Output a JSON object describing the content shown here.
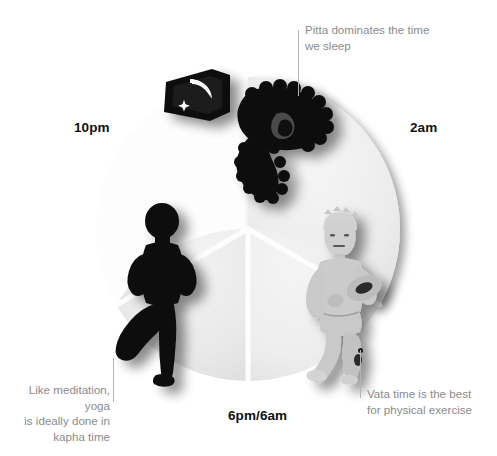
{
  "diagram": {
    "title_present": false,
    "shape": "circle-divided-in-three",
    "segments": [
      {
        "id": "pitta",
        "name": "pitta-segment",
        "position": "top",
        "fill": "#efefef",
        "icon_names": [
          "window-with-moon-and-star-icon",
          "sleeping-person-in-bed-icon"
        ]
      },
      {
        "id": "kapha",
        "name": "kapha-segment",
        "position": "bottom-left",
        "fill": "#ededed",
        "icon_names": [
          "yoga-tree-pose-silhouette-icon"
        ]
      },
      {
        "id": "vata",
        "name": "vata-segment",
        "position": "bottom-right",
        "fill": "#f2f2f2",
        "icon_names": [
          "running-person-with-football-icon"
        ]
      }
    ]
  },
  "time_labels": {
    "left": "10pm",
    "right": "2am",
    "bottom": "6pm/6am"
  },
  "annotations": {
    "pitta": "Pitta dominates the time\nwe sleep",
    "kapha": "Like meditation, yoga\nis ideally done in\nkapha time",
    "vata": "Vata time is the best\nfor physical exercise"
  },
  "colors": {
    "background": "#ffffff",
    "dial_light": "#efefef",
    "dial_mid": "#e6e6e6",
    "divider": "#ffffff",
    "time_label_text": "#111111",
    "annotation_text": "#8b8b8b",
    "leader_line": "#b4b4b4",
    "dark_figure": "#101010",
    "light_figure": "#c9c9c9"
  }
}
